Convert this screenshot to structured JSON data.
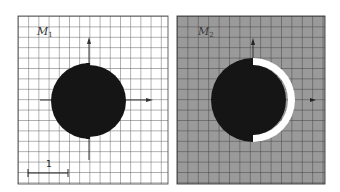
{
  "figure": {
    "panels": [
      {
        "id": "M1",
        "label_main": "M",
        "label_sub": "1",
        "background": "#ffffff",
        "grid_color": "#555555",
        "shape": "black disk with a small step on the vertical axis"
      },
      {
        "id": "M2",
        "label_main": "M",
        "label_sub": "2",
        "background": "#9a9a9a",
        "grid_color": "#333333",
        "shape": "black disk with white crescent on right half"
      }
    ],
    "scale_bar": {
      "label": "1"
    },
    "colors": {
      "disk": "#151515",
      "crescent": "#ffffff",
      "axis": "#333333"
    }
  }
}
